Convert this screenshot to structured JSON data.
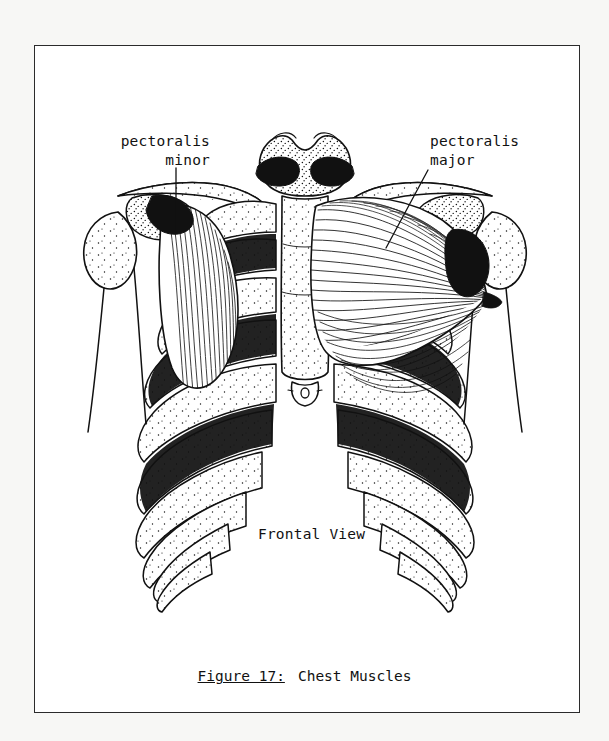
{
  "page": {
    "background_color": "#f7f7f5",
    "sheet_color": "#ffffff",
    "border_color": "#2b2b2b",
    "ink_color": "#111111"
  },
  "figure": {
    "title_label": "Frontal View",
    "view": "anterior",
    "style": "pen-and-ink line drawing with stipple shading"
  },
  "labels": [
    {
      "id": "pectoralis-minor",
      "line1": "pectoralis",
      "line2": "minor",
      "side": "left",
      "leader": "vertical line from label down to muscle body"
    },
    {
      "id": "pectoralis-major",
      "line1": "pectoralis",
      "line2": "major",
      "side": "right",
      "leader": "diagonal line from label down-left to muscle body"
    }
  ],
  "caption": {
    "figure_number": "Figure 17:",
    "title": "Chest Muscles",
    "underlined_part": "Figure 17"
  },
  "anatomy": {
    "structures": [
      "clavicle",
      "sternum",
      "manubrium",
      "xiphoid process",
      "ribs",
      "costal cartilage",
      "humerus",
      "scapula",
      "pectoralis major",
      "pectoralis minor"
    ],
    "rib_pairs_visible": 10
  }
}
